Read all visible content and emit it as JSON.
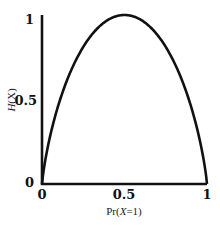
{
  "chart_data": {
    "type": "line",
    "title": "",
    "xlabel": "Pr(X=1)",
    "ylabel": "H(X)",
    "xlim": [
      0,
      1
    ],
    "ylim": [
      0,
      1
    ],
    "x_ticks": [
      "0",
      "0.5",
      "1"
    ],
    "y_ticks": [
      "0",
      "0.5",
      "1"
    ],
    "grid": false,
    "legend": null,
    "series": [
      {
        "name": "binary entropy H(X)",
        "x": [
          0,
          0.05,
          0.1,
          0.2,
          0.3,
          0.4,
          0.5,
          0.6,
          0.7,
          0.8,
          0.9,
          0.95,
          1
        ],
        "values": [
          0,
          0.286,
          0.469,
          0.722,
          0.881,
          0.971,
          1.0,
          0.971,
          0.881,
          0.722,
          0.469,
          0.286,
          0
        ]
      }
    ]
  },
  "labels": {
    "xlabel_prefix": "Pr(",
    "xlabel_var": "X",
    "xlabel_suffix": "=1)",
    "ylabel_var": "H",
    "ylabel_rest": "(X)"
  }
}
